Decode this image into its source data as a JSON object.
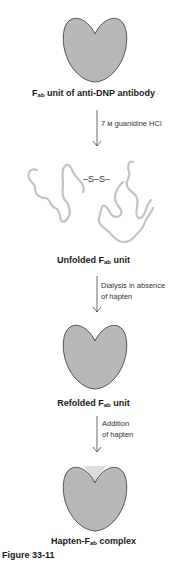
{
  "figure": {
    "label": "Figure 33-11",
    "colors": {
      "protein_fill": "#b8b8b8",
      "protein_outline": "#555555",
      "chain": "#c4c4c4",
      "hapten_fill": "#dcdcdc",
      "arrow": "#444444",
      "text": "#1a1a1a"
    }
  },
  "stages": [
    {
      "id": "native",
      "label_prefix": "F",
      "label_sub": "ab",
      "label_suffix": " unit of anti-DNP antibody"
    },
    {
      "id": "unfolded",
      "label_prefix": "Unfolded F",
      "label_sub": "ab",
      "label_suffix": " unit",
      "disulfide": "–S–S–"
    },
    {
      "id": "refolded",
      "label_prefix": "Refolded F",
      "label_sub": "ab",
      "label_suffix": " unit"
    },
    {
      "id": "complex",
      "label_prefix": "Hapten-F",
      "label_sub": "ab",
      "label_suffix": " complex"
    }
  ],
  "steps": [
    {
      "lines": [
        "7 м guanidine HCl"
      ]
    },
    {
      "lines": [
        "Dialysis in absence",
        "of hapten"
      ]
    },
    {
      "lines": [
        "Addition",
        "of hapten"
      ]
    }
  ]
}
